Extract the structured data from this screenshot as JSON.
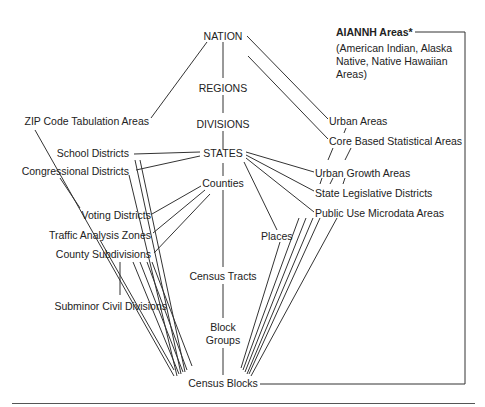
{
  "diagram": {
    "type": "hierarchy",
    "nodes": {
      "nation": "NATION",
      "regions": "REGIONS",
      "divisions": "DIVISIONS",
      "states": "STATES",
      "counties": "Counties",
      "census_tracts": "Census Tracts",
      "block_groups_1": "Block",
      "block_groups_2": "Groups",
      "census_blocks": "Census Blocks",
      "zcta": "ZIP Code Tabulation Areas",
      "school_districts": "School Districts",
      "congressional_districts": "Congressional Districts",
      "voting_districts": "Voting Districts",
      "traffic_analysis_zones": "Traffic Analysis Zones",
      "county_subdivisions": "County Subdivisions",
      "subminor_civil_divisions": "Subminor Civil Divisions",
      "places": "Places",
      "urban_areas": "Urban Areas",
      "cbsa": "Core Based Statistical Areas",
      "urban_growth_areas": "Urban Growth Areas",
      "state_legislative_districts": "State Legislative Districts",
      "puma": "Public Use Microdata Areas",
      "aiannh": "AIANNH Areas*",
      "aiannh_note": "(American Indian, Alaska Native, Native Hawaiian Areas)"
    },
    "edges": [
      [
        "NATION",
        "REGIONS"
      ],
      [
        "REGIONS",
        "DIVISIONS"
      ],
      [
        "DIVISIONS",
        "STATES"
      ],
      [
        "STATES",
        "Counties"
      ],
      [
        "Counties",
        "Census Tracts"
      ],
      [
        "Census Tracts",
        "Block Groups"
      ],
      [
        "Block Groups",
        "Census Blocks"
      ],
      [
        "NATION",
        "ZIP Code Tabulation Areas"
      ],
      [
        "NATION",
        "Urban Areas"
      ],
      [
        "NATION",
        "Core Based Statistical Areas"
      ],
      [
        "STATES",
        "School Districts"
      ],
      [
        "STATES",
        "Congressional Districts"
      ],
      [
        "STATES",
        "Urban Growth Areas"
      ],
      [
        "STATES",
        "State Legislative Districts"
      ],
      [
        "STATES",
        "Public Use Microdata Areas"
      ],
      [
        "STATES",
        "Places"
      ],
      [
        "Counties",
        "Voting Districts"
      ],
      [
        "Counties",
        "Traffic Analysis Zones"
      ],
      [
        "Counties",
        "County Subdivisions"
      ],
      [
        "County Subdivisions",
        "Subminor Civil Divisions"
      ],
      [
        "AIANNH Areas",
        "Census Blocks"
      ]
    ]
  }
}
